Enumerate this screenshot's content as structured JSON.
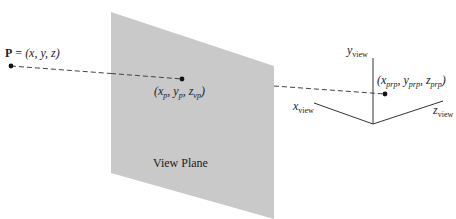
{
  "diagram": {
    "plane": {
      "label": "View Plane",
      "fill": "#c9c9c9",
      "corners": [
        [
          111,
          12
        ],
        [
          274,
          66
        ],
        [
          274,
          219
        ],
        [
          111,
          173
        ]
      ]
    },
    "point_p": {
      "symbol": "P",
      "equals": " = ",
      "coords_text": "(x, y, z)",
      "position": [
        11,
        66
      ]
    },
    "projected_point": {
      "label_parts": [
        "(x",
        "p",
        ", y",
        "p",
        ", z",
        "vp",
        ")"
      ],
      "position": [
        182,
        80
      ]
    },
    "prp_point": {
      "label_parts": [
        "(x",
        "prp",
        ", y",
        "prp",
        ", z",
        "prp",
        ")"
      ],
      "position": [
        385,
        94
      ]
    },
    "axes": {
      "origin": [
        373,
        124
      ],
      "y_axis": {
        "label_main": "y",
        "label_sub": "view",
        "end": [
          373,
          58
        ]
      },
      "x_axis": {
        "label_main": "x",
        "label_sub": "view",
        "end": [
          314,
          103
        ]
      },
      "z_axis": {
        "label_main": "z",
        "label_sub": "view",
        "end": [
          443,
          101
        ]
      }
    },
    "colors": {
      "line": "#333333",
      "dash": "#444444",
      "point": "#111111"
    }
  }
}
